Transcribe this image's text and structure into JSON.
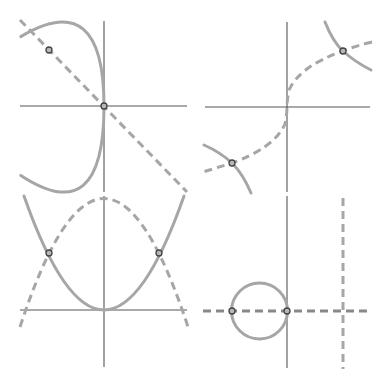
{
  "figure": {
    "colors": {
      "axis": "#555555",
      "curve": "#a6a6a6",
      "point_stroke": "#444444",
      "point_fill": "#b8b8b8",
      "background": "#ffffff"
    },
    "panels": [
      {
        "id": "top-left",
        "solid": "x = -y^2 (left-opening parabola)",
        "dashed": "y = -x (line)",
        "intersections": [
          [
            0,
            0
          ],
          [
            -1,
            1
          ]
        ]
      },
      {
        "id": "top-right",
        "solid": "y = 1/x (hyperbola)",
        "dashed": "y = cbrt(x) (cube root curve)",
        "intersections": [
          [
            1,
            1
          ],
          [
            -1,
            -1
          ]
        ]
      },
      {
        "id": "bottom-left",
        "solid": "y = x^2 (parabola)",
        "dashed": "y = 2 - x^2 (downward parabola)",
        "intersections": [
          [
            -1,
            1
          ],
          [
            1,
            1
          ]
        ]
      },
      {
        "id": "bottom-right",
        "solid": "(x + 0.5)^2 + y^2 = 0.25 (circle)",
        "dashed": "y = 0 and x = 1 (lines)",
        "intersections": [
          [
            -1,
            0
          ],
          [
            0,
            0
          ]
        ]
      }
    ]
  }
}
